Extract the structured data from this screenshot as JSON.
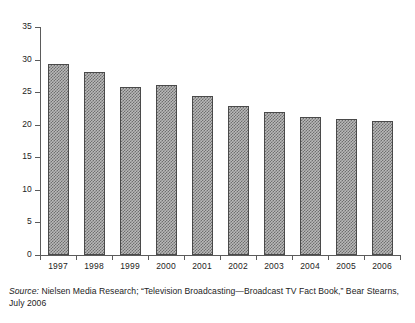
{
  "chart_data": {
    "type": "bar",
    "title": "",
    "subtitle": "",
    "xlabel": "",
    "ylabel": "",
    "categories": [
      "1997",
      "1998",
      "1999",
      "2000",
      "2001",
      "2002",
      "2003",
      "2004",
      "2005",
      "2006"
    ],
    "values": [
      29.3,
      28.1,
      25.8,
      26.1,
      24.4,
      22.9,
      21.9,
      21.2,
      20.9,
      20.6
    ],
    "series": [
      {
        "name": "",
        "values": [
          29.3,
          28.1,
          25.8,
          26.1,
          24.4,
          22.9,
          21.9,
          21.2,
          20.9,
          20.6
        ]
      }
    ],
    "ylim": [
      0,
      35
    ],
    "yticks": [
      0,
      5,
      10,
      15,
      20,
      25,
      30,
      35
    ],
    "ytick_labels": [
      "0",
      "5",
      "10",
      "15",
      "20",
      "25",
      "30",
      "35"
    ],
    "grid": false,
    "legend": null,
    "legend_position": "none",
    "bar_fill": "crosshatch-gray",
    "bar_edge_color": "#4a4a4a",
    "axis_color": "#5b5b5b",
    "background_color": "#ffffff"
  },
  "caption": {
    "source_word": "Source:",
    "text": " Nielsen Media Research; “Television Broadcasting—Broadcast TV Fact Book,” Bear Stearns, July 2006"
  }
}
